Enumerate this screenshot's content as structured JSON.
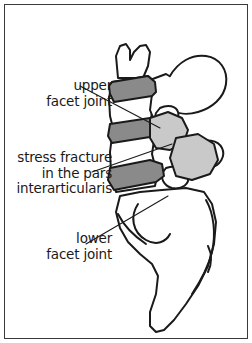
{
  "figure": {
    "kind": "anatomical-illustration",
    "background_color": "#ffffff",
    "frame_color": "#3a3a3a",
    "outline_color": "#1a1a1a",
    "bone_fill_color": "#ffffff",
    "facet_shade_color": "#c9c9c9",
    "fracture_shade_color": "#8a8a8a",
    "text_color": "#1a1a1a"
  },
  "labels": {
    "upper_facet": {
      "line1": "upper",
      "line2": "facet joint"
    },
    "stress_fracture": {
      "line1": "stress fracture",
      "line2": "in the pars",
      "line3": "interarticularis"
    },
    "lower_facet": {
      "line1": "lower",
      "line2": "facet joint"
    }
  }
}
